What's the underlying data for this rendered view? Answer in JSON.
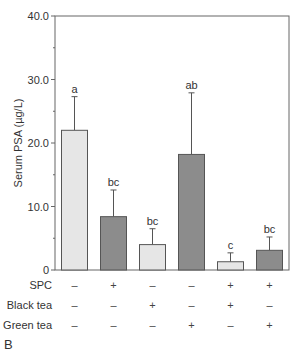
{
  "panel_label": "B",
  "chart_data": {
    "type": "bar",
    "title": "",
    "xlabel": "",
    "ylabel": "Serum PSA (µg/L)",
    "ylim": [
      0,
      40
    ],
    "yticks": [
      0,
      10.0,
      20.0,
      30.0,
      40.0
    ],
    "ytick_labels": [
      "0",
      "10.0",
      "20.0",
      "30.0",
      "40.0"
    ],
    "grid": false,
    "legend": null,
    "categories": [
      "Control",
      "SPC",
      "Black tea",
      "Green tea",
      "SPC + Black tea",
      "SPC + Green tea"
    ],
    "values": [
      22.0,
      8.4,
      4.0,
      18.2,
      1.3,
      3.1
    ],
    "error_upper": [
      27.3,
      12.6,
      6.5,
      27.9,
      2.7,
      5.2
    ],
    "significance_letters": [
      "a",
      "bc",
      "bc",
      "ab",
      "c",
      "bc"
    ],
    "bar_fill": [
      "light",
      "dark",
      "light",
      "dark",
      "light",
      "dark"
    ],
    "colors": {
      "light": "#e6e6e6",
      "dark": "#8c8c8c",
      "edge": "#555555",
      "axis": "#666666"
    },
    "treatment_rows": [
      {
        "label": "SPC",
        "signs": [
          "–",
          "+",
          "–",
          "–",
          "+",
          "+"
        ]
      },
      {
        "label": "Black tea",
        "signs": [
          "–",
          "–",
          "+",
          "–",
          "+",
          "–"
        ]
      },
      {
        "label": "Green tea",
        "signs": [
          "–",
          "–",
          "–",
          "+",
          "–",
          "+"
        ]
      }
    ]
  }
}
